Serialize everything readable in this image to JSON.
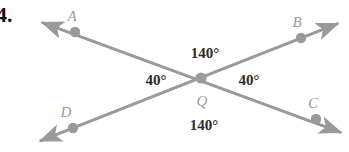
{
  "problem": {
    "number": "4."
  },
  "figure": {
    "type": "intersecting-lines-vertical-angles",
    "stroke_color": "#9a9a9a",
    "dot_color": "#9a9a9a",
    "label_color": "#9a9a9a",
    "angle_text_color": "#2b2b2b",
    "background": "#ffffff",
    "points": [
      {
        "name": "A",
        "label": "A",
        "x": 75,
        "y": 32,
        "label_x": 72,
        "label_y": 16
      },
      {
        "name": "B",
        "label": "B",
        "x": 301,
        "y": 38,
        "label_x": 297,
        "label_y": 22
      },
      {
        "name": "C",
        "label": "C",
        "x": 316,
        "y": 119,
        "label_x": 313,
        "label_y": 103
      },
      {
        "name": "D",
        "label": "D",
        "x": 73,
        "y": 128,
        "label_x": 66,
        "label_y": 112
      },
      {
        "name": "Q",
        "label": "Q",
        "x": 201,
        "y": 78,
        "label_x": 202,
        "label_y": 101
      }
    ],
    "lines": [
      {
        "name": "line-A-C",
        "x1": 38,
        "y1": 21,
        "x2": 345,
        "y2": 134
      },
      {
        "name": "line-D-B",
        "x1": 36,
        "y1": 143,
        "x2": 342,
        "y2": 22
      }
    ],
    "angles": [
      {
        "name": "angle-top",
        "value": "140°",
        "x": 205,
        "y": 53
      },
      {
        "name": "angle-left",
        "value": "40°",
        "x": 156,
        "y": 80
      },
      {
        "name": "angle-right",
        "value": "40°",
        "x": 249,
        "y": 80
      },
      {
        "name": "angle-bottom",
        "value": "140°",
        "x": 204,
        "y": 125
      }
    ]
  }
}
